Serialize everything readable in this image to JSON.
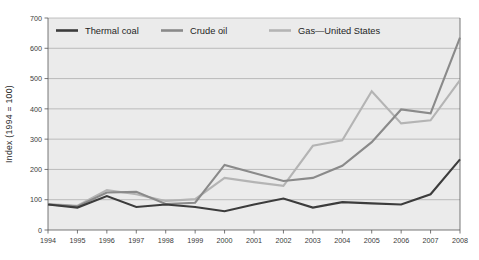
{
  "chart_data": {
    "type": "line",
    "title": "",
    "subtitle": "",
    "xlabel": "",
    "ylabel": "Index (1994 = 100)",
    "xlim": [
      1994,
      2008
    ],
    "ylim": [
      0,
      700
    ],
    "grid": true,
    "legend_position": "top-inside",
    "x": [
      1994,
      1995,
      1996,
      1997,
      1998,
      1999,
      2000,
      2001,
      2002,
      2003,
      2004,
      2005,
      2006,
      2007,
      2008
    ],
    "categories": [
      "1994",
      "1995",
      "1996",
      "1997",
      "1998",
      "1999",
      "2000",
      "2001",
      "2002",
      "2003",
      "2004",
      "2005",
      "2006",
      "2007",
      "2008"
    ],
    "yticks": [
      0,
      100,
      200,
      300,
      400,
      500,
      600,
      700
    ],
    "ytick_labels": [
      "0",
      "100",
      "200",
      "300",
      "400",
      "500",
      "600",
      "700"
    ],
    "series": [
      {
        "name": "Thermal coal",
        "color": "#3c3c3c",
        "values": [
          84,
          74,
          112,
          76,
          84,
          76,
          62,
          84,
          104,
          74,
          92,
          88,
          84,
          118,
          233
        ]
      },
      {
        "name": "Crude oil",
        "color": "#8a8a8a",
        "values": [
          84,
          78,
          124,
          126,
          86,
          90,
          215,
          188,
          162,
          172,
          212,
          290,
          398,
          385,
          635
        ]
      },
      {
        "name": "Gas—United States",
        "color": "#b4b4b4",
        "values": [
          86,
          80,
          132,
          118,
          96,
          102,
          172,
          158,
          146,
          278,
          296,
          458,
          352,
          362,
          495
        ]
      }
    ]
  },
  "legend": {
    "items": [
      {
        "label": "Thermal coal",
        "color": "#3c3c3c"
      },
      {
        "label": "Crude oil",
        "color": "#8a8a8a"
      },
      {
        "label": "Gas—United States",
        "color": "#b4b4b4"
      }
    ]
  },
  "axes": {
    "y_title": "Index (1994 = 100)"
  }
}
